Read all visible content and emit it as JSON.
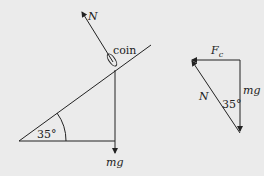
{
  "left_diagram": {
    "angle_label": "35°",
    "normal_label": "N",
    "object_label": "coin",
    "weight_label": "mg"
  },
  "right_diagram": {
    "friction_label_main": "F",
    "friction_label_sub": "c",
    "normal_label": "N",
    "angle_label": "35°",
    "weight_label": "mg"
  },
  "colors": {
    "background": "#ebebeb",
    "stroke": "#222222"
  }
}
